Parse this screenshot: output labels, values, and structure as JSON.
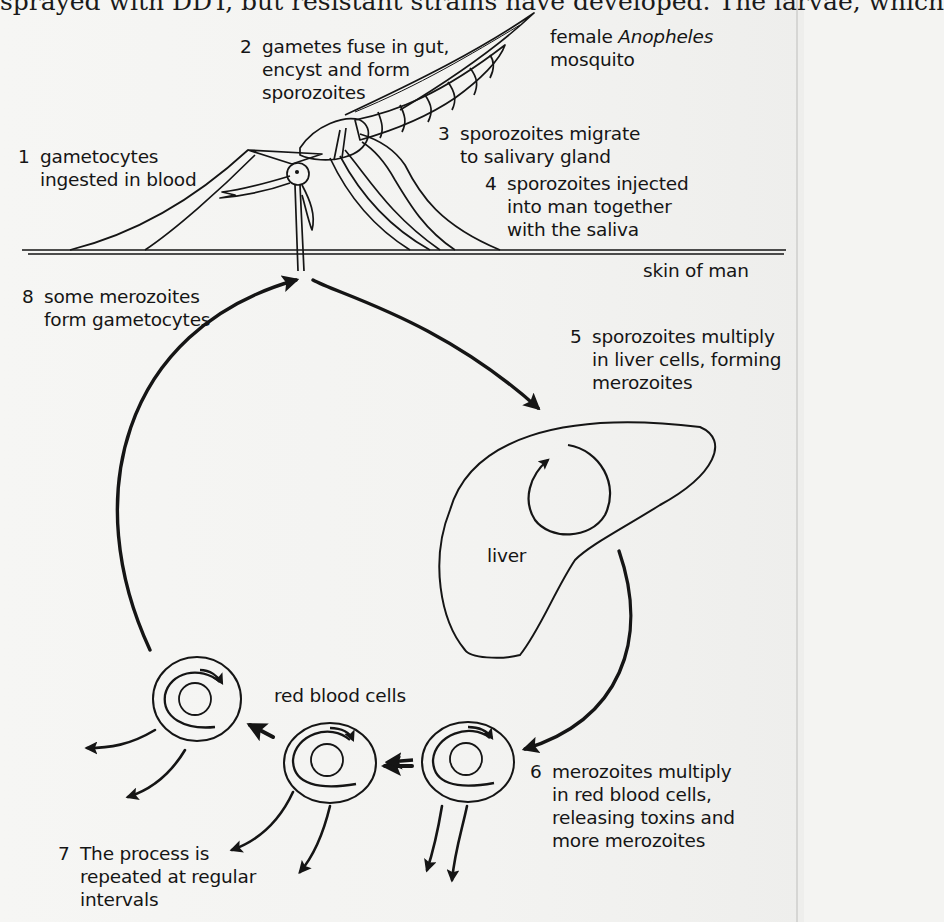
{
  "page": {
    "clipped_top_text": "sprayed with DDT, but resistant strains have developed. The larvae, which"
  },
  "diagram": {
    "mosquito_label": {
      "line1_prefix": "female ",
      "line1_italic": "Anopheles",
      "line2": "mosquito"
    },
    "skin_label": "skin of man",
    "liver_label": "liver",
    "rbc_label": "red blood cells",
    "steps": [
      {
        "num": "1",
        "lines": [
          "gametocytes",
          "ingested in blood"
        ]
      },
      {
        "num": "2",
        "lines": [
          "gametes fuse in gut,",
          "encyst and form",
          "sporozoites"
        ]
      },
      {
        "num": "3",
        "lines": [
          "sporozoites migrate",
          "to salivary gland"
        ]
      },
      {
        "num": "4",
        "lines": [
          "sporozoites injected",
          "into man together",
          "with the saliva"
        ]
      },
      {
        "num": "5",
        "lines": [
          "sporozoites multiply",
          "in liver cells, forming",
          "merozoites"
        ]
      },
      {
        "num": "6",
        "lines": [
          "merozoites multiply",
          "in red blood cells,",
          "releasing toxins and",
          "more merozoites"
        ]
      },
      {
        "num": "7",
        "lines": [
          "The process is",
          "repeated at regular",
          "intervals"
        ]
      },
      {
        "num": "8",
        "lines": [
          "some merozoites",
          "form gametocytes"
        ]
      }
    ]
  }
}
